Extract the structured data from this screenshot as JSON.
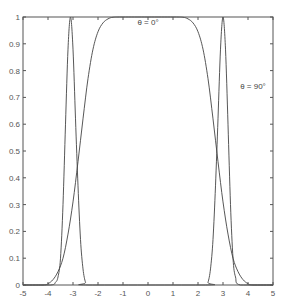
{
  "chart_data": {
    "type": "line",
    "title": "",
    "xlabel": "",
    "ylabel": "",
    "xlim": [
      -5,
      5
    ],
    "ylim": [
      0,
      1
    ],
    "grid": false,
    "legend": "none (inline annotations)",
    "x_ticks": [
      "-5",
      "-4",
      "-3",
      "-2",
      "-1",
      "0",
      "1",
      "2",
      "3",
      "4",
      "5"
    ],
    "y_ticks": [
      "0",
      "0.1",
      "0.2",
      "0.3",
      "0.4",
      "0.5",
      "0.6",
      "0.7",
      "0.8",
      "0.9",
      "1"
    ],
    "annotations": [
      {
        "text": "θ = 0°",
        "x": 0.0,
        "y": 0.97
      },
      {
        "text": "θ = 90°",
        "x": 4.2,
        "y": 0.73
      }
    ],
    "series": [
      {
        "name": "θ = 0°",
        "x": [
          -5,
          -4.2,
          -4.0,
          -3.8,
          -3.6,
          -3.4,
          -3.2,
          -3.0,
          -2.8,
          -2.6,
          -2.4,
          -2.2,
          -2.0,
          -1.8,
          -1.6,
          -1.4,
          -1.0,
          0,
          1.0,
          1.4,
          1.6,
          1.8,
          2.0,
          2.2,
          2.4,
          2.6,
          2.8,
          3.0,
          3.2,
          3.4,
          3.6,
          3.8,
          4.0,
          4.2,
          5
        ],
        "y": [
          0,
          0,
          0.005,
          0.02,
          0.05,
          0.1,
          0.19,
          0.31,
          0.46,
          0.62,
          0.77,
          0.88,
          0.945,
          0.978,
          0.993,
          0.999,
          1,
          1,
          1,
          0.999,
          0.993,
          0.978,
          0.945,
          0.88,
          0.77,
          0.62,
          0.46,
          0.31,
          0.19,
          0.1,
          0.05,
          0.02,
          0.005,
          0,
          0
        ]
      },
      {
        "name": "θ = 90°",
        "x": [
          -5,
          -3.9,
          -3.7,
          -3.6,
          -3.5,
          -3.4,
          -3.3,
          -3.2,
          -3.1,
          -3.0,
          -2.9,
          -2.8,
          -2.7,
          -2.6,
          -2.5,
          -2.4,
          2.3,
          2.4,
          2.5,
          2.6,
          2.7,
          2.8,
          2.9,
          3.0,
          3.1,
          3.2,
          3.3,
          3.4,
          3.5,
          3.7,
          5
        ],
        "y": [
          0,
          0,
          0.01,
          0.03,
          0.1,
          0.3,
          0.6,
          0.88,
          1.0,
          0.88,
          0.62,
          0.37,
          0.17,
          0.06,
          0.01,
          0,
          0,
          0.01,
          0.06,
          0.17,
          0.37,
          0.62,
          0.88,
          1.0,
          0.88,
          0.6,
          0.3,
          0.1,
          0.03,
          0,
          0
        ]
      }
    ]
  },
  "plot_area": {
    "left": 23,
    "top": 17,
    "right": 273,
    "bottom": 285
  },
  "colors": {
    "axis": "#555555",
    "line": "#444444",
    "background": "#ffffff"
  }
}
